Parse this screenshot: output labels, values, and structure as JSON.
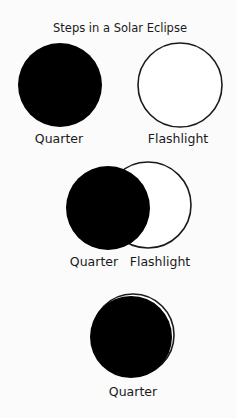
{
  "title": "Steps in a Solar Eclipse",
  "colors": {
    "background": "#fbfbfb",
    "quarter_fill": "#000000",
    "flashlight_stroke": "#1a1a1a",
    "flashlight_fill": "#ffffff"
  },
  "steps": [
    {
      "step": 1,
      "quarter": {
        "label": "Quarter",
        "cx": 60,
        "cy": 85,
        "r": 42
      },
      "flashlight": {
        "label": "Flashlight",
        "cx": 180,
        "cy": 85,
        "r": 42
      }
    },
    {
      "step": 2,
      "quarter": {
        "label": "Quarter",
        "cx": 108,
        "cy": 208,
        "r": 42
      },
      "flashlight": {
        "label": "Flashlight",
        "cx": 148,
        "cy": 205,
        "r": 43
      }
    },
    {
      "step": 3,
      "quarter": {
        "label": "Quarter",
        "cx": 131,
        "cy": 337,
        "r": 41
      },
      "flashlight": {
        "label": "",
        "cx": 133,
        "cy": 335,
        "r": 41
      }
    }
  ]
}
